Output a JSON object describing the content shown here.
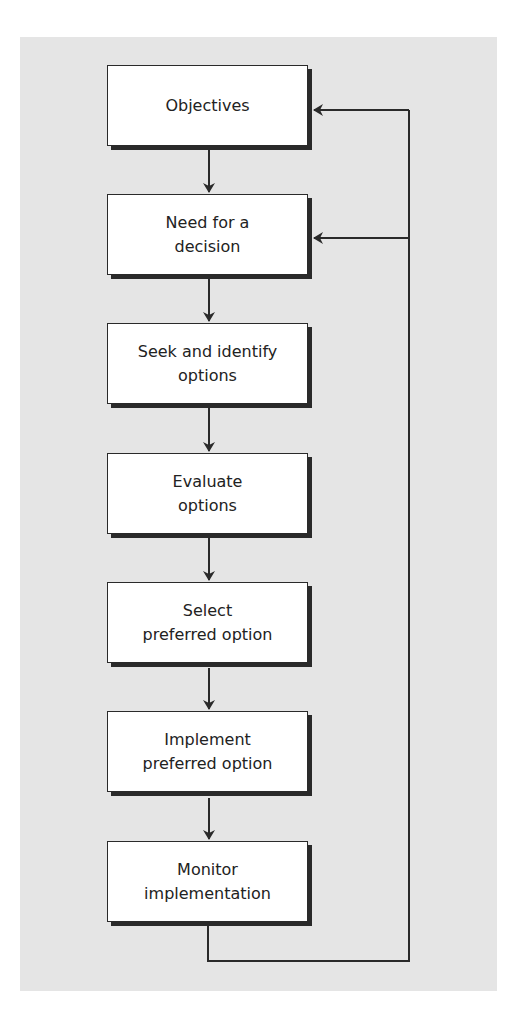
{
  "diagram": {
    "type": "flowchart",
    "steps": [
      {
        "lines": [
          "Objectives"
        ]
      },
      {
        "lines": [
          "Need for a",
          "decision"
        ]
      },
      {
        "lines": [
          "Seek and identify",
          "options"
        ]
      },
      {
        "lines": [
          "Evaluate",
          "options"
        ]
      },
      {
        "lines": [
          "Select",
          "preferred option"
        ]
      },
      {
        "lines": [
          "Implement",
          "preferred option"
        ]
      },
      {
        "lines": [
          "Monitor",
          "implementation"
        ]
      }
    ],
    "feedback": "Monitor implementation loops back to Objectives and Need for a decision",
    "colors": {
      "panel": "#e5e5e5",
      "box": "#ffffff",
      "stroke": "#2a2a2a",
      "text": "#222222"
    }
  }
}
